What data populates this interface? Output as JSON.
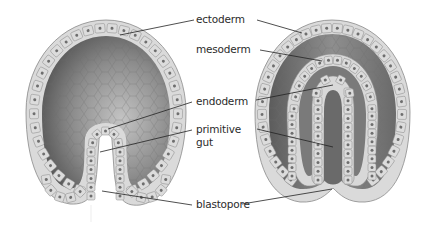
{
  "diagram": {
    "panels": [
      {
        "id": "left",
        "description": "early gastrula with invaginating primitive gut"
      },
      {
        "id": "right",
        "description": "late gastrula with three germ layers"
      }
    ],
    "labels": [
      {
        "id": "ectoderm",
        "text": "ectoderm"
      },
      {
        "id": "mesoderm",
        "text": "mesoderm"
      },
      {
        "id": "endoderm",
        "text": "endoderm"
      },
      {
        "id": "primitive-gut",
        "text_line1": "primitive",
        "text_line2": "gut"
      },
      {
        "id": "blastopore",
        "text": "blastopore"
      }
    ],
    "colors": {
      "cell_fill": "#dcdcdc",
      "cell_stroke": "#8a8a8a",
      "nucleus": "#6e6e6e",
      "cavity_dark": "#5a5a5a",
      "cavity_light": "#b8b8b8",
      "leader_line": "#222222",
      "label_text": "#2b2b2b"
    }
  }
}
